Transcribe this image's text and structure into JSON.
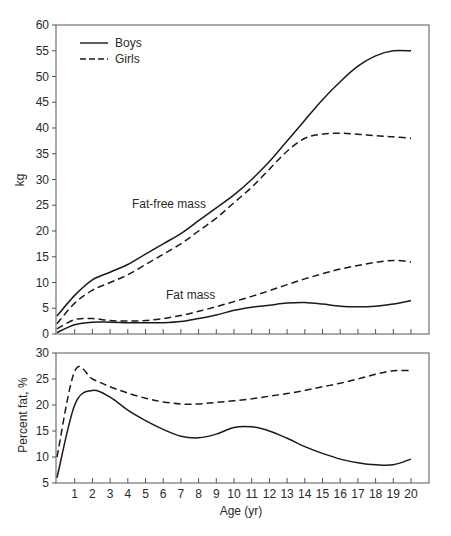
{
  "chart_data": [
    {
      "type": "line",
      "title": "",
      "xlabel": "",
      "ylabel": "kg",
      "ylim": [
        0,
        60
      ],
      "yticks": [
        0,
        5,
        10,
        15,
        20,
        25,
        30,
        35,
        40,
        45,
        50,
        55,
        60
      ],
      "xlim": [
        0,
        20
      ],
      "grid": false,
      "legend": {
        "position": "upper-left",
        "entries": [
          "Boys",
          "Girls"
        ],
        "styles": [
          "solid",
          "dashed"
        ]
      },
      "annotations": [
        "Fat-free mass",
        "Fat mass"
      ],
      "x": [
        0,
        1,
        2,
        3,
        4,
        5,
        6,
        7,
        8,
        9,
        10,
        11,
        12,
        13,
        14,
        15,
        16,
        17,
        18,
        19,
        20
      ],
      "series": [
        {
          "name": "Boys fat-free mass",
          "style": "solid",
          "values": [
            3.5,
            7.5,
            10.5,
            12,
            13.5,
            15.5,
            17.5,
            19.5,
            22,
            24.5,
            27,
            30,
            33.5,
            37.5,
            41.5,
            45.5,
            49,
            52,
            54,
            55,
            55
          ]
        },
        {
          "name": "Girls fat-free mass",
          "style": "dashed",
          "values": [
            2,
            6,
            8.5,
            10,
            11.5,
            13.5,
            15.5,
            17.5,
            20,
            22.5,
            25.5,
            28.5,
            32,
            35.5,
            38,
            38.8,
            39,
            38.8,
            38.5,
            38.3,
            38
          ]
        },
        {
          "name": "Boys fat mass",
          "style": "solid",
          "values": [
            0.3,
            1.8,
            2.3,
            2.3,
            2.2,
            2.2,
            2.2,
            2.4,
            3,
            3.7,
            4.6,
            5.2,
            5.6,
            6,
            6.1,
            5.8,
            5.4,
            5.3,
            5.4,
            5.8,
            6.5
          ]
        },
        {
          "name": "Girls fat mass",
          "style": "dashed",
          "values": [
            1,
            2.8,
            3,
            2.6,
            2.5,
            2.6,
            3,
            3.6,
            4.4,
            5.3,
            6.3,
            7.3,
            8.4,
            9.6,
            10.7,
            11.7,
            12.6,
            13.3,
            13.9,
            14.3,
            14
          ]
        }
      ]
    },
    {
      "type": "line",
      "title": "",
      "xlabel": "Age (yr)",
      "ylabel": "Percent fat, %",
      "ylim": [
        5,
        30
      ],
      "yticks": [
        5,
        10,
        15,
        20,
        25,
        30
      ],
      "xlim": [
        0,
        20
      ],
      "xticks": [
        1,
        2,
        3,
        4,
        5,
        6,
        7,
        8,
        9,
        10,
        11,
        12,
        13,
        14,
        15,
        16,
        17,
        18,
        19,
        20
      ],
      "grid": false,
      "x": [
        0,
        1,
        2,
        3,
        4,
        5,
        6,
        7,
        8,
        9,
        10,
        11,
        12,
        13,
        14,
        15,
        16,
        17,
        18,
        19,
        20
      ],
      "series": [
        {
          "name": "Boys",
          "style": "solid",
          "values": [
            6,
            20,
            22.8,
            21.5,
            19,
            17,
            15.3,
            14,
            13.7,
            14.4,
            15.7,
            15.8,
            15,
            13.6,
            12,
            10.7,
            9.6,
            8.9,
            8.5,
            8.5,
            9.6
          ]
        },
        {
          "name": "Girls",
          "style": "dashed",
          "values": [
            10,
            26.5,
            25,
            23.5,
            22.3,
            21.3,
            20.6,
            20.2,
            20.2,
            20.5,
            20.8,
            21.2,
            21.7,
            22.2,
            22.8,
            23.5,
            24.2,
            25,
            25.9,
            26.6,
            26.6
          ]
        }
      ]
    }
  ],
  "labels": {
    "legend_boys": "Boys",
    "legend_girls": "Girls",
    "annotation_ffm": "Fat-free mass",
    "annotation_fm": "Fat mass",
    "top_ylabel": "kg",
    "bottom_ylabel": "Percent fat, %",
    "xlabel": "Age (yr)"
  },
  "colors": {
    "line": "#1a1a1a",
    "axis": "#555555",
    "text": "#2a2a2a"
  }
}
